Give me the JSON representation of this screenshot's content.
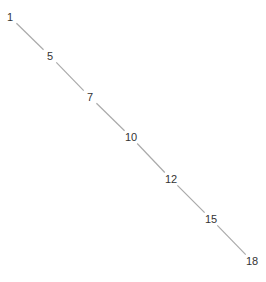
{
  "diagram": {
    "type": "linear-path",
    "line_color": "#aaaaaa",
    "text_color": "#333333",
    "nodes": [
      {
        "label": "1",
        "x": 10,
        "y": 17
      },
      {
        "label": "5",
        "x": 50,
        "y": 56
      },
      {
        "label": "7",
        "x": 90,
        "y": 97
      },
      {
        "label": "10",
        "x": 131,
        "y": 137
      },
      {
        "label": "12",
        "x": 171,
        "y": 179
      },
      {
        "label": "15",
        "x": 211,
        "y": 219
      },
      {
        "label": "18",
        "x": 252,
        "y": 261
      }
    ]
  }
}
